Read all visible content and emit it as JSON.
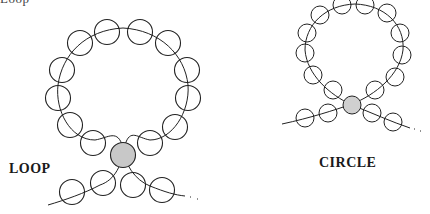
{
  "figure": {
    "type": "beading technique diagram",
    "cropped_top_text": "Loop",
    "colors": {
      "stroke": "#222222",
      "bead_fill": "#ffffff",
      "highlight_bead_fill": "#c8c8c8"
    },
    "panels": [
      {
        "id": "loop",
        "label": "LOOP",
        "bead_radius": 12.5,
        "ring_beads": [
          [
            107,
            32
          ],
          [
            140,
            32
          ],
          [
            80,
            43
          ],
          [
            168,
            43
          ],
          [
            62,
            70
          ],
          [
            187,
            70
          ],
          [
            58,
            98
          ],
          [
            188,
            98
          ],
          [
            70,
            125
          ],
          [
            175,
            127
          ],
          [
            93,
            143
          ],
          [
            150,
            143
          ]
        ],
        "center_bead": [
          123,
          155
        ],
        "tail_beads": [
          [
            72,
            192
          ],
          [
            103,
            183
          ],
          [
            133,
            185
          ],
          [
            162,
            190
          ]
        ]
      },
      {
        "id": "circle",
        "label": "CIRCLE",
        "bead_radius": 9,
        "ring_beads": [
          [
            342,
            5
          ],
          [
            365,
            5
          ],
          [
            320,
            15
          ],
          [
            387,
            13
          ],
          [
            307,
            33
          ],
          [
            400,
            33
          ],
          [
            305,
            53
          ],
          [
            402,
            55
          ],
          [
            313,
            75
          ],
          [
            395,
            77
          ],
          [
            333,
            90
          ],
          [
            375,
            90
          ]
        ],
        "center_bead": [
          352,
          105
        ],
        "tail_beads": [
          [
            305,
            118
          ],
          [
            328,
            113
          ],
          [
            372,
            113
          ],
          [
            393,
            122
          ]
        ]
      }
    ]
  }
}
